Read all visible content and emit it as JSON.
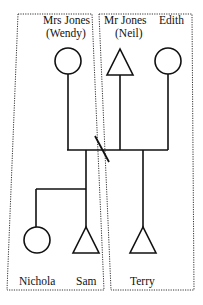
{
  "diagram": {
    "type": "genogram",
    "households": [
      {
        "id": "left",
        "members": [
          "Mrs Jones (Wendy)",
          "Nichola",
          "Sam"
        ]
      },
      {
        "id": "right",
        "members": [
          "Mr Jones (Neil)",
          "Edith",
          "Terry"
        ]
      }
    ],
    "people": {
      "wendy": {
        "line1": "Mrs Jones",
        "line2": "(Wendy)",
        "sex": "female",
        "symbol": "circle"
      },
      "neil": {
        "line1": "Mr Jones",
        "line2": "(Neil)",
        "sex": "male",
        "symbol": "triangle"
      },
      "edith": {
        "line1": "Edith",
        "sex": "female",
        "symbol": "circle"
      },
      "nichola": {
        "line1": "Nichola",
        "sex": "female",
        "symbol": "circle"
      },
      "sam": {
        "line1": "Sam",
        "sex": "male",
        "symbol": "triangle"
      },
      "terry": {
        "line1": "Terry",
        "sex": "male",
        "symbol": "triangle"
      }
    },
    "relationships": [
      {
        "from": "wendy",
        "to": "neil",
        "type": "separated",
        "marker": "slash"
      },
      {
        "from": "neil",
        "to": "edith",
        "type": "partnership"
      },
      {
        "parents": [
          "wendy",
          "neil"
        ],
        "children": [
          "nichola",
          "sam"
        ]
      },
      {
        "parents": [
          "neil",
          "edith"
        ],
        "children": [
          "terry"
        ]
      }
    ]
  }
}
